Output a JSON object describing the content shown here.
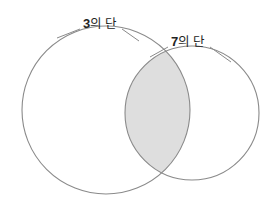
{
  "figure": {
    "name": "venn-diagram",
    "type": "two-set-venn",
    "width": 274,
    "height": 205,
    "background_color": "#ffffff"
  },
  "colors": {
    "stroke": "#8a8a8a",
    "intersection_fill": "#dedede",
    "set_fill": "#ffffff",
    "label_text": "#232323"
  },
  "sets": [
    {
      "id": "left",
      "label": "3의 단",
      "label_number": "3",
      "label_unit": "의 단",
      "cx": 106,
      "cy": 110,
      "r": 84,
      "leader_from": [
        80,
        29
      ],
      "leader_to": [
        57,
        37
      ]
    },
    {
      "id": "right",
      "label": "7의 단",
      "label_number": "7",
      "label_unit": "의 단",
      "cx": 192,
      "cy": 113,
      "r": 67,
      "leader_from": [
        169,
        47
      ],
      "leader_to": [
        148,
        56
      ]
    }
  ],
  "intersection": {
    "name": "intersection-region",
    "shaded": true,
    "fill": "#dedede",
    "top_point": [
      145,
      55
    ],
    "bottom_point": [
      152,
      173
    ]
  },
  "leader_lines": [
    {
      "name": "leader-line-left",
      "x1": 80,
      "y1": 29,
      "x2": 57,
      "y2": 38
    },
    {
      "name": "leader-line-left-right",
      "x1": 122,
      "y1": 29,
      "x2": 139,
      "y2": 41
    },
    {
      "name": "leader-line-right",
      "x1": 168,
      "y1": 47,
      "x2": 150,
      "y2": 57
    },
    {
      "name": "leader-line-right-right",
      "x1": 210,
      "y1": 47,
      "x2": 231,
      "y2": 62
    }
  ]
}
